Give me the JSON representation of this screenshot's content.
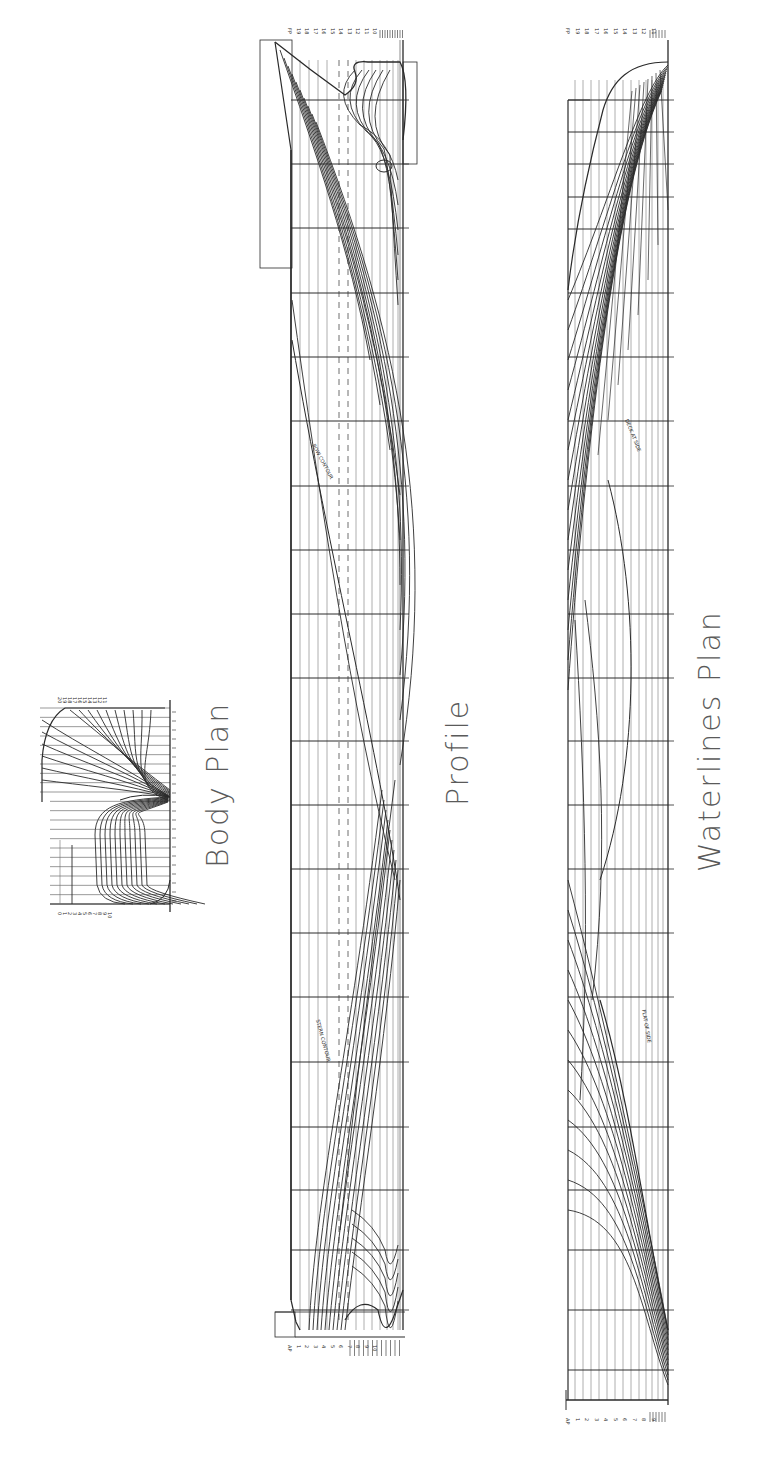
{
  "titles": {
    "body_plan": "Body Plan",
    "profile": "Profile",
    "waterlines_plan": "Waterlines Plan"
  },
  "colors": {
    "ink": "#2a2a2a",
    "grid": "#6e6e6e",
    "light_grid": "#9a9a9a",
    "title": "#5a5a5a",
    "background": "#ffffff"
  },
  "profile": {
    "frame": {
      "x_deck": 291,
      "x_base": 403,
      "y_top": 40,
      "y_bottom": 1330
    },
    "dashed_lines_x": [
      339,
      348
    ],
    "buttock_lines_x": [
      300,
      309,
      318,
      327,
      356,
      364,
      372,
      380,
      387,
      393,
      398
    ],
    "station_lines_y": [
      100,
      164,
      228,
      293,
      357,
      421,
      486,
      550,
      614,
      678,
      741,
      805,
      869,
      933,
      997,
      1062,
      1127,
      1190,
      1250,
      1310
    ],
    "annotations": [
      "BOW CONTOUR",
      "STERN CONTOUR"
    ]
  },
  "waterlines_plan": {
    "frame": {
      "x_outer": 566,
      "x_center": 668,
      "y_top": 60,
      "y_bottom": 1405
    },
    "waterline_x": [
      575,
      583,
      591,
      599,
      607,
      615,
      623,
      631,
      639,
      646,
      652,
      658,
      663
    ],
    "station_lines_y": [
      100,
      132,
      164,
      197,
      229,
      293,
      357,
      421,
      486,
      550,
      614,
      678,
      741,
      805,
      869,
      933,
      997,
      1062,
      1127,
      1190,
      1250,
      1310,
      1370
    ],
    "annotations": [
      "DECK AT SIDE",
      "FLAT OF SIDE"
    ]
  },
  "body_plan": {
    "frame": {
      "x_left": 40,
      "x_center": 170,
      "y_top": 708,
      "y_bottom": 904,
      "y_mid": 797
    },
    "waterline_count": 22,
    "station_labels_fwd": [
      "20",
      "19",
      "18",
      "17",
      "16",
      "15",
      "14",
      "13",
      "12",
      "11"
    ],
    "station_labels_aft": [
      "0",
      "1",
      "2",
      "3",
      "4",
      "5",
      "6",
      "7",
      "8",
      "9",
      "10"
    ]
  },
  "scale_labels": {
    "profile_top": [
      "FP",
      "19",
      "18",
      "17",
      "16",
      "15",
      "14",
      "13",
      "12",
      "11",
      "10"
    ],
    "profile_bottom": [
      "AP",
      "1",
      "2",
      "3",
      "4",
      "5",
      "6",
      "7",
      "8",
      "9",
      "10"
    ],
    "waterlines_top": [
      "FP",
      "19",
      "18",
      "17",
      "16",
      "15",
      "14",
      "13",
      "12",
      "11"
    ],
    "waterlines_bottom": [
      "AP",
      "1",
      "2",
      "3",
      "4",
      "5",
      "6",
      "7",
      "8",
      "9"
    ]
  }
}
